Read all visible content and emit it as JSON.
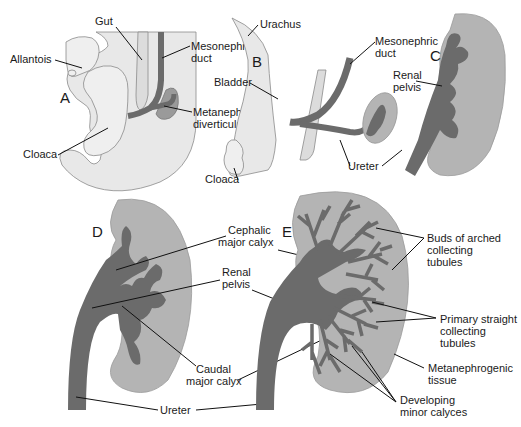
{
  "figure": {
    "panels": [
      "A",
      "B",
      "C",
      "D",
      "E"
    ],
    "colors": {
      "background": "#ffffff",
      "embryo_tissue": "#e8e8e8",
      "metanephrogenic_tissue": "#b4b4b4",
      "ducts": "#6b6b6b",
      "leader_lines": "#111111"
    }
  },
  "panel_a": {
    "letter": "A",
    "labels": {
      "gut": "Gut",
      "allantois": "Allantois",
      "mesonephric_duct_1": "Mesonephric",
      "mesonephric_duct_2": "duct",
      "metanephric_1": "Metanephric",
      "metanephric_2": "diverticulum",
      "cloaca": "Cloaca"
    }
  },
  "panel_b": {
    "letter": "B",
    "labels": {
      "urachus": "Urachus",
      "bladder": "Bladder",
      "cloaca": "Cloaca",
      "mesonephric_duct_1": "Mesonephric",
      "mesonephric_duct_2": "duct",
      "ureter": "Ureter"
    }
  },
  "panel_c": {
    "letter": "C",
    "labels": {
      "renal_pelvis_1": "Renal",
      "renal_pelvis_2": "pelvis"
    }
  },
  "panel_d": {
    "letter": "D",
    "labels": {
      "cephalic_1": "Cephalic",
      "cephalic_2": "major calyx",
      "renal_pelvis_1": "Renal",
      "renal_pelvis_2": "pelvis",
      "caudal_1": "Caudal",
      "caudal_2": "major calyx",
      "ureter": "Ureter"
    }
  },
  "panel_e": {
    "letter": "E",
    "labels": {
      "buds_1": "Buds of arched",
      "buds_2": "collecting",
      "buds_3": "tubules",
      "primary_1": "Primary straight",
      "primary_2": "collecting",
      "primary_3": "tubules",
      "metaneph_1": "Metanephrogenic",
      "metaneph_2": "tissue",
      "minor_1": "Developing",
      "minor_2": "minor calyces"
    }
  }
}
